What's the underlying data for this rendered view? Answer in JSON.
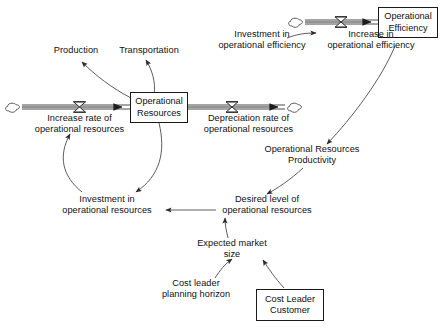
{
  "diagram": {
    "type": "system-dynamics-stock-and-flow",
    "background_color": "#ffffff",
    "line_color": "#3a3a3a",
    "text_color": "#101010"
  },
  "stocks": [
    {
      "id": "operational-resources",
      "line1": "Operational",
      "line2": "Resources"
    },
    {
      "id": "operational-efficiency",
      "line1": "Operational",
      "line2": "Efficiency"
    },
    {
      "id": "cost-leader-customer",
      "line1": "Cost Leader",
      "line2": "Customer"
    }
  ],
  "flows": [
    {
      "id": "increase-rate-operational-resources",
      "line1": "Increase rate of",
      "line2": "operational resources"
    },
    {
      "id": "depreciation-rate-operational-resources",
      "line1": "Depreciation rate of",
      "line2": "operational resources"
    },
    {
      "id": "increase-in-operational-efficiency",
      "line1": "Increase in",
      "line2": "operational efficiency"
    }
  ],
  "variables": [
    {
      "id": "production",
      "line1": "Production",
      "line2": ""
    },
    {
      "id": "transportation",
      "line1": "Transportation",
      "line2": ""
    },
    {
      "id": "investment-in-operational-efficiency",
      "line1": "Investment in",
      "line2": "operational efficiency"
    },
    {
      "id": "operational-resources-productivity",
      "line1": "Operational Resources",
      "line2": "Productivity"
    },
    {
      "id": "desired-level-of-operational-resources",
      "line1": "Desired level of",
      "line2": "operational resources"
    },
    {
      "id": "investment-in-operational-resources",
      "line1": "Investment in",
      "line2": "operational resources"
    },
    {
      "id": "expected-market-size",
      "line1": "Expected market",
      "line2": "size"
    },
    {
      "id": "cost-leader-planning-horizon",
      "line1": "Cost leader",
      "line2": "planning horizon"
    }
  ]
}
